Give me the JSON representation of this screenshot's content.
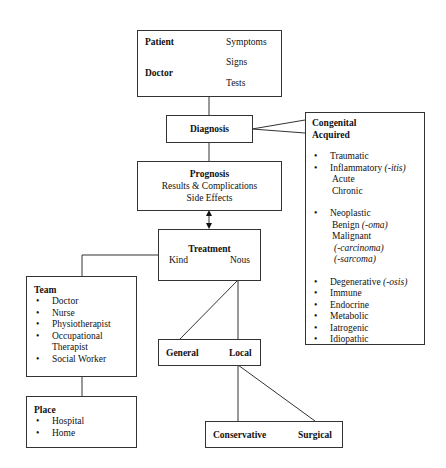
{
  "top_box": {
    "patient": "Patient",
    "doctor": "Doctor",
    "symptoms": "Symptoms",
    "signs": "Signs",
    "tests": "Tests"
  },
  "diagnosis": {
    "label": "Diagnosis"
  },
  "etiology": {
    "heading1": "Congenital",
    "heading2": "Acquired",
    "bullet": "•",
    "items": [
      {
        "label": "Traumatic"
      },
      {
        "label": "Inflammatory",
        "suffix": "(-itis)",
        "subs": [
          "Acute",
          "Chronic"
        ]
      },
      {
        "label": "Neoplastic",
        "benign": "Benign",
        "benign_suffix": "(-oma)",
        "malignant": "Malignant",
        "mal_sub1": "(-carcinoma)",
        "mal_sub2": "(-sarcoma)"
      },
      {
        "label": "Degenerative",
        "suffix": "(-osis)"
      },
      {
        "label": "Immune"
      },
      {
        "label": "Endocrine"
      },
      {
        "label": "Metabolic"
      },
      {
        "label": "Iatrogenic"
      },
      {
        "label": "Idiopathic"
      }
    ]
  },
  "prognosis": {
    "title": "Prognosis",
    "line1": "Results & Complications",
    "line2": "Side Effects"
  },
  "treatment": {
    "title": "Treatment",
    "kind": "Kind",
    "nous": "Nous"
  },
  "team": {
    "title": "Team",
    "items": [
      "Doctor",
      "Nurse",
      "Physiotherapist",
      "Occupational",
      "Therapist",
      "Social Worker"
    ]
  },
  "place": {
    "title": "Place",
    "items": [
      "Hospital",
      "Home"
    ]
  },
  "scope": {
    "general": "General",
    "local": "Local"
  },
  "approach": {
    "conservative": "Conservative",
    "surgical": "Surgical"
  }
}
